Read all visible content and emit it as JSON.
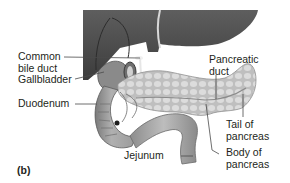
{
  "figure": {
    "panel_label": "(b)",
    "labels": {
      "common_bile_duct": [
        "Common",
        "bile duct"
      ],
      "gallbladder": "Gallbladder",
      "duodenum": "Duodenum",
      "pancreatic_duct": [
        "Pancreatic",
        "duct"
      ],
      "tail_of_pancreas": [
        "Tail of",
        "pancreas"
      ],
      "body_of_pancreas": [
        "Body of",
        "pancreas"
      ],
      "jejunum": "Jejunum"
    },
    "colors": {
      "liver": "#5a5a5a",
      "liver_dark": "#3e3e3e",
      "pancreas": "#c9c9c9",
      "pancreas_lobule": "#e2e2e2",
      "duodenum": "#9a9a9a",
      "jejunum": "#a8a8a8",
      "leader_line": "#4a4a4a",
      "text": "#231f20"
    }
  }
}
